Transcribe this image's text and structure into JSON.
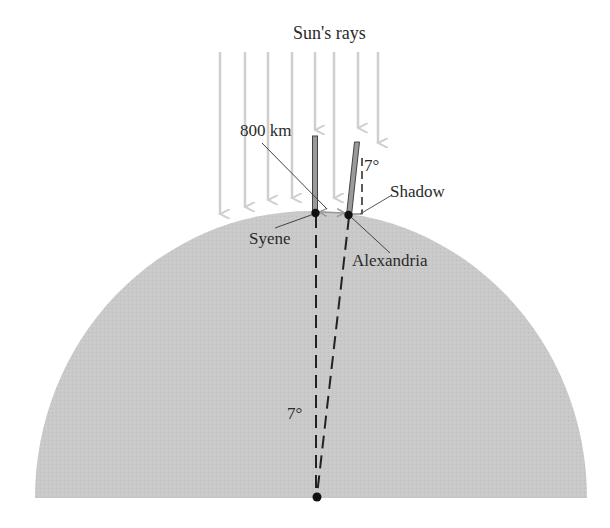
{
  "diagram": {
    "title": "Sun's rays",
    "labels": {
      "sun_rays": "Sun's rays",
      "distance": "800 km",
      "shadow_angle": "7°",
      "shadow": "Shadow",
      "syene": "Syene",
      "alexandria": "Alexandria",
      "center_angle": "7°"
    },
    "colors": {
      "earth_fill": "#c8c8c8",
      "ray": "#cfcfcf",
      "line": "#333333",
      "stick": "#888888",
      "dot": "#111111"
    },
    "elements": [
      "sun-rays",
      "gnomon-syene",
      "gnomon-alexandria",
      "earth-dome",
      "radial-lines",
      "earth-center"
    ]
  }
}
